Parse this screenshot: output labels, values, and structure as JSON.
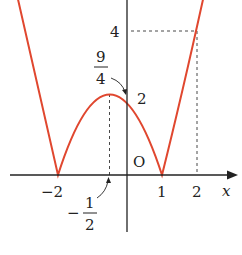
{
  "figure": {
    "function": "y = |x^2 + x - 2|",
    "curve_color": "#e0472f",
    "axis_color": "#222222",
    "axes": {
      "x_label": "x",
      "origin_label": "O"
    },
    "labels": {
      "y4": "4",
      "y2": "2",
      "vertex_y_num": "9",
      "vertex_y_den": "4",
      "x_neg2": "−2",
      "x_1": "1",
      "x_2": "2",
      "x_neg_half_sign": "−",
      "x_neg_half_num": "1",
      "x_neg_half_den": "2"
    },
    "key_points": [
      {
        "x": -2,
        "y": 0
      },
      {
        "x": 1,
        "y": 0
      },
      {
        "x": -0.5,
        "y": 2.25
      },
      {
        "x": 0,
        "y": 2
      },
      {
        "x": 2,
        "y": 4
      }
    ]
  }
}
